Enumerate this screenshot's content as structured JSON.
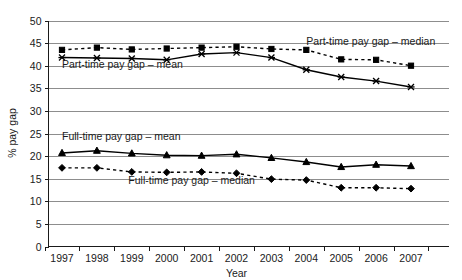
{
  "chart_data": {
    "type": "line",
    "title": "",
    "xlabel": "Year",
    "ylabel": "% pay gap",
    "categories": [
      "1997",
      "1998",
      "1999",
      "2000",
      "2001",
      "2002",
      "2003",
      "2004",
      "2005",
      "2006",
      "2007"
    ],
    "x": [
      1997,
      1998,
      1999,
      2000,
      2001,
      2002,
      2003,
      2004,
      2005,
      2006,
      2007
    ],
    "ylim": [
      0,
      50
    ],
    "ytick_step": 5,
    "yticks": [
      "0",
      "5",
      "10",
      "15",
      "20",
      "25",
      "30",
      "35",
      "40",
      "45",
      "50"
    ],
    "grid": true,
    "legend_position": "inline-annotations",
    "series": [
      {
        "name": "Part-time pay gap – median",
        "marker": "square",
        "linestyle": "dashed",
        "values": [
          43.5,
          44.0,
          43.6,
          43.8,
          44.0,
          44.2,
          43.7,
          43.5,
          41.4,
          41.3,
          40.0
        ]
      },
      {
        "name": "Part-time pay gap – mean",
        "marker": "cross",
        "linestyle": "solid",
        "values": [
          41.8,
          41.7,
          41.6,
          41.3,
          42.6,
          42.9,
          41.8,
          39.1,
          37.5,
          36.6,
          35.3
        ]
      },
      {
        "name": "Full-time pay gap – mean",
        "marker": "triangle",
        "linestyle": "solid",
        "values": [
          20.7,
          21.2,
          20.6,
          20.2,
          20.1,
          20.4,
          19.6,
          18.7,
          17.6,
          18.1,
          17.8
        ]
      },
      {
        "name": "Full-time pay gap – median",
        "marker": "diamond",
        "linestyle": "dashed",
        "values": [
          17.4,
          17.4,
          16.5,
          16.4,
          16.5,
          16.2,
          14.9,
          14.7,
          13.0,
          13.0,
          12.8
        ]
      }
    ],
    "annotations": [
      {
        "text": "Part-time pay gap – median",
        "x": 2004.0,
        "y": 44.6
      },
      {
        "text": "Part-time pay gap – mean",
        "x": 1997.0,
        "y": 39.5
      },
      {
        "text": "Full-time pay gap – mean",
        "x": 1997.0,
        "y": 23.6
      },
      {
        "text": "Full-time pay gap – median",
        "x": 1998.9,
        "y": 13.8
      }
    ]
  }
}
